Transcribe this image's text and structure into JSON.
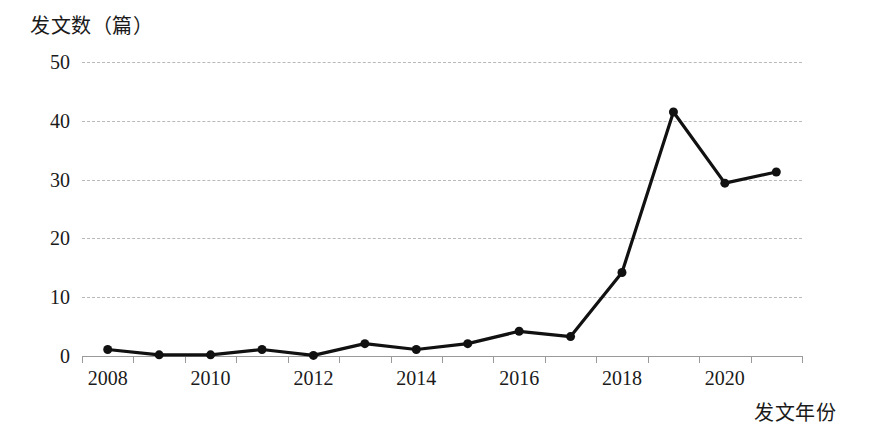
{
  "chart_data": {
    "type": "line",
    "title": "",
    "subtitle": "",
    "ylabel": "发文数（篇）",
    "xlabel": "发文年份",
    "categories": [
      2008,
      2009,
      2010,
      2011,
      2012,
      2013,
      2014,
      2015,
      2016,
      2017,
      2018,
      2019,
      2020,
      2021
    ],
    "x": [
      2008,
      2009,
      2010,
      2011,
      2012,
      2013,
      2014,
      2015,
      2016,
      2017,
      2018,
      2019,
      2020,
      2021
    ],
    "series": [
      {
        "name": "发文数",
        "values": [
          1.1,
          0.2,
          0.2,
          1.1,
          0.1,
          2.1,
          1.1,
          2.1,
          4.2,
          3.3,
          14.2,
          41.5,
          29.4,
          31.3
        ]
      }
    ],
    "values": [
      1.1,
      0.2,
      0.2,
      1.1,
      0.1,
      2.1,
      1.1,
      2.1,
      4.2,
      3.3,
      14.2,
      41.5,
      29.4,
      31.3
    ],
    "ylim": [
      0,
      50
    ],
    "xlim": [
      2007.5,
      2021.5
    ],
    "y_ticks": [
      0,
      10,
      20,
      30,
      40,
      50
    ],
    "y_tick_labels": [
      "0",
      "10",
      "20",
      "30",
      "40",
      "50"
    ],
    "x_tick_labels": [
      "2008",
      "2010",
      "2012",
      "2014",
      "2016",
      "2018",
      "2020"
    ],
    "x_tick_values": [
      2008,
      2010,
      2012,
      2014,
      2016,
      2018,
      2020
    ],
    "grid": {
      "horizontal": true,
      "vertical": false,
      "style": "dashed",
      "color": "#b9b9b9"
    },
    "legend": {
      "visible": false,
      "position": "none",
      "entries": []
    },
    "annotations": [],
    "marker": {
      "shape": "circle",
      "filled": true,
      "color": "#111111",
      "size": 9
    },
    "line": {
      "color": "#111111",
      "width": 3.2,
      "style": "solid"
    },
    "colors": {
      "background": "#ffffff",
      "series": "#111111",
      "axis": "#9a9a9a",
      "grid": "#b9b9b9",
      "text": "#1a1a1a"
    }
  }
}
